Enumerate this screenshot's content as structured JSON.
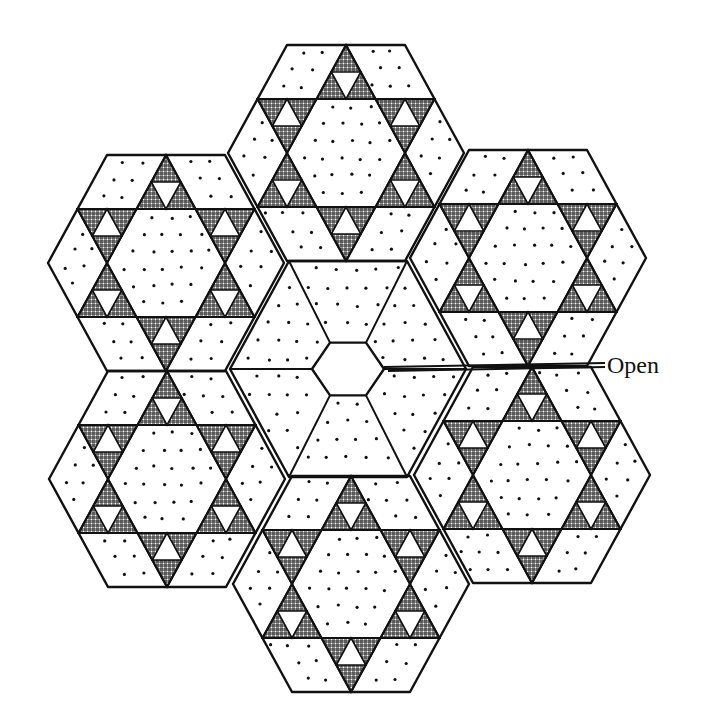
{
  "figure": {
    "label_open": "Open",
    "label_position": {
      "x": 607,
      "y": 352
    },
    "colors": {
      "line": "#111111",
      "background": "#ffffff",
      "hatch": "#111111"
    },
    "hex_side": 118,
    "hex_height": 216,
    "center": {
      "x": 348,
      "y": 369
    },
    "center_hole_radius": 24,
    "outer_hexagons": [
      {
        "name": "top",
        "cx": 346,
        "cy": 153
      },
      {
        "name": "upper-left",
        "cx": 166,
        "cy": 263
      },
      {
        "name": "upper-right",
        "cx": 528,
        "cy": 258
      },
      {
        "name": "lower-left",
        "cx": 167,
        "cy": 479
      },
      {
        "name": "lower-right",
        "cx": 532,
        "cy": 475
      },
      {
        "name": "bottom",
        "cx": 351,
        "cy": 584
      }
    ]
  }
}
